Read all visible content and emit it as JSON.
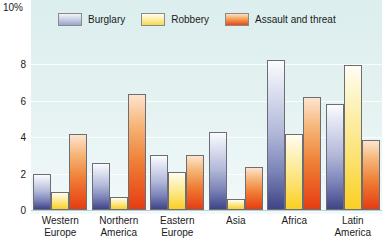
{
  "chart_data": {
    "type": "bar",
    "title": "",
    "xlabel": "",
    "ylabel": "10%",
    "ylim": [
      0,
      10
    ],
    "yticks": [
      8,
      6,
      4,
      2,
      0
    ],
    "ytick_labels": [
      "8",
      "6",
      "4",
      "2",
      "0"
    ],
    "axis_top_label": "10%",
    "grid": true,
    "legend_position": "top",
    "categories": [
      "Western Europe",
      "Northern America",
      "Eastern Europe",
      "Asia",
      "Africa",
      "Latin America"
    ],
    "category_lines": [
      [
        "Western",
        "Europe"
      ],
      [
        "Northern",
        "America"
      ],
      [
        "Eastern",
        "Europe"
      ],
      [
        "Asia",
        ""
      ],
      [
        "Africa",
        ""
      ],
      [
        "Latin",
        "America"
      ]
    ],
    "series": [
      {
        "name": "Burglary",
        "color": "#3f4486",
        "values": [
          2.0,
          2.6,
          3.05,
          4.3,
          8.25,
          5.85
        ]
      },
      {
        "name": "Robbery",
        "color": "#fbcf22",
        "values": [
          1.0,
          0.7,
          2.1,
          0.6,
          4.2,
          7.95
        ]
      },
      {
        "name": "Assault and threat",
        "color": "#e63c12",
        "values": [
          4.15,
          6.35,
          3.05,
          2.35,
          6.2,
          3.85
        ]
      }
    ]
  },
  "legend": {
    "items": [
      {
        "label": "Burglary",
        "swatch": "burglary-swatch"
      },
      {
        "label": "Robbery",
        "swatch": "robbery-swatch"
      },
      {
        "label": "Assault and threat",
        "swatch": "assault-swatch"
      }
    ]
  }
}
